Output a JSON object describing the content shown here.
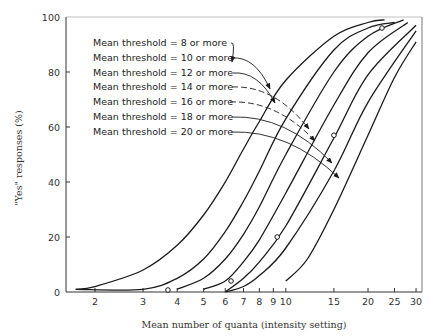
{
  "chart_data": {
    "type": "line",
    "title": "",
    "xlabel": "Mean number of quanta (intensity setting)",
    "ylabel": "\"Yes\" responses (%)",
    "xscale": "log",
    "xlim": [
      1.6,
      30
    ],
    "ylim": [
      0,
      100
    ],
    "grid": false,
    "x_ticks": [
      2,
      3,
      4,
      5,
      6,
      7,
      8,
      9,
      10,
      15,
      20,
      25,
      30
    ],
    "x_tick_labels": [
      "2",
      "3",
      "4",
      "5",
      "6",
      "7",
      "8",
      "9",
      "10",
      "15",
      "20",
      "25",
      "30"
    ],
    "y_ticks": [
      0,
      20,
      40,
      60,
      80,
      100
    ],
    "y_tick_labels": [
      "0",
      "20",
      "40",
      "60",
      "80",
      "100"
    ],
    "legend_position": "upper-left (labels with arrows to curves)",
    "series": [
      {
        "name": "Mean threshold = 8 or more",
        "x": [
          1.7,
          2,
          3,
          4,
          5,
          6,
          7,
          8,
          10,
          15,
          20,
          23
        ],
        "y": [
          1,
          2,
          8,
          17,
          28,
          40,
          52,
          62,
          77,
          93,
          98,
          99
        ]
      },
      {
        "name": "Mean threshold = 10 or more",
        "x": [
          1.7,
          3,
          4,
          5,
          6,
          7,
          8,
          10,
          15,
          20,
          25
        ],
        "y": [
          1,
          1,
          5,
          12,
          22,
          33,
          44,
          63,
          88,
          96,
          98
        ]
      },
      {
        "name": "Mean threshold = 12 or more",
        "x": [
          4,
          5,
          6,
          7,
          8,
          10,
          15,
          20,
          27
        ],
        "y": [
          1,
          5,
          12,
          21,
          31,
          50,
          80,
          93,
          99
        ]
      },
      {
        "name": "Mean threshold = 14 or more",
        "x": [
          5,
          6,
          7,
          8,
          10,
          15,
          20,
          28
        ],
        "y": [
          1,
          4,
          11,
          19,
          36,
          68,
          87,
          98
        ]
      },
      {
        "name": "Mean threshold = 16 or more",
        "x": [
          6,
          7,
          8,
          10,
          15,
          20,
          30
        ],
        "y": [
          0,
          5,
          11,
          24,
          56,
          79,
          97
        ]
      },
      {
        "name": "Mean threshold = 18 or more",
        "x": [
          6,
          7,
          8,
          10,
          15,
          20,
          30
        ],
        "y": [
          0,
          2,
          6,
          16,
          44,
          69,
          95
        ]
      },
      {
        "name": "Mean threshold = 20 or more",
        "x": [
          10,
          12,
          15,
          20,
          25,
          30
        ],
        "y": [
          4,
          12,
          30,
          57,
          78,
          91
        ]
      }
    ],
    "observed_points": {
      "x": [
        3.7,
        6.3,
        9.3,
        15,
        22.5
      ],
      "y": [
        0,
        4,
        20,
        57,
        96
      ],
      "marker": "open-circle"
    }
  },
  "legend": {
    "items": [
      "Mean threshold = 8 or more",
      "Mean threshold = 10 or more",
      "Mean threshold = 12 or more",
      "Mean threshold = 14 or more",
      "Mean threshold = 16 or more",
      "Mean threshold = 18 or more",
      "Mean threshold = 20 or more"
    ]
  },
  "axes": {
    "xlabel": "Mean number of quanta (intensity setting)",
    "ylabel": "\"Yes\" responses (%)"
  },
  "colors": {
    "line": "#1a1a1a",
    "axis": "#333333",
    "background": "#ffffff"
  }
}
